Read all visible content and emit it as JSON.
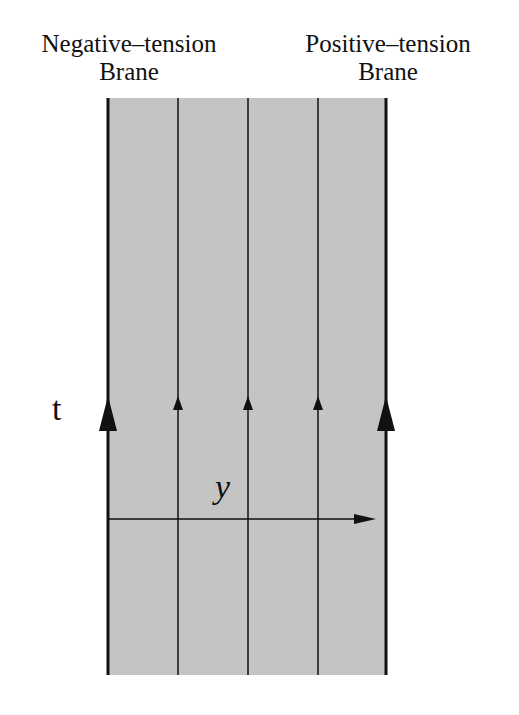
{
  "labels": {
    "negative_brane": [
      "Negative–tension",
      "Brane"
    ],
    "positive_brane": [
      "Positive–tension",
      "Brane"
    ],
    "time_axis": "t",
    "space_axis": "y"
  },
  "diagram": {
    "bulk_fill": "#c4c4c4",
    "line_color": "#111111",
    "region": {
      "x0": 108,
      "x1": 386,
      "y0": 98,
      "y1": 675
    },
    "brane_lines_x": [
      108,
      386
    ],
    "interior_lines_x": [
      178,
      248,
      318
    ],
    "time_arrow_y": 400,
    "y_axis": {
      "y": 519,
      "x_start": 108,
      "x_end": 375
    }
  }
}
